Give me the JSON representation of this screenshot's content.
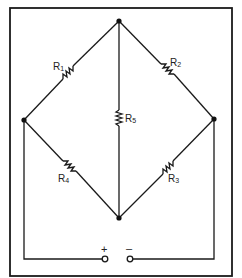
{
  "diagram": {
    "type": "wheatstone-bridge-circuit",
    "resistors": [
      {
        "id": "R1",
        "letter": "R",
        "sub": "1",
        "branch": "left-node to top-node"
      },
      {
        "id": "R2",
        "letter": "R",
        "sub": "2",
        "branch": "top-node to right-node"
      },
      {
        "id": "R3",
        "letter": "R",
        "sub": "3",
        "branch": "right-node to bottom-node"
      },
      {
        "id": "R4",
        "letter": "R",
        "sub": "4",
        "branch": "left-node to bottom-node"
      },
      {
        "id": "R5",
        "letter": "R",
        "sub": "5",
        "branch": "top-node to bottom-node (bridge)"
      }
    ],
    "terminals": {
      "positive": "+",
      "negative": "–"
    },
    "colors": {
      "line": "#1a1a1a",
      "background": "#ffffff"
    }
  }
}
